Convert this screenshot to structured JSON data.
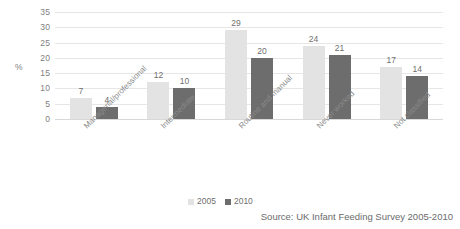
{
  "chart_data": {
    "type": "bar",
    "title": "",
    "subtitle": "",
    "xlabel": "",
    "ylabel": "%",
    "ylim": [
      0,
      35
    ],
    "ytick_step": 5,
    "yticks": [
      "35",
      "30",
      "25",
      "20",
      "15",
      "10",
      "5",
      "0"
    ],
    "grid": true,
    "legend_position": "bottom",
    "categories": [
      "Managerial/professional",
      "Intermediate",
      "Routine and manual",
      "Never worked",
      "Not classified"
    ],
    "series": [
      {
        "name": "2005",
        "color": "#e3e3e3",
        "values": [
          7,
          12,
          29,
          24,
          17
        ]
      },
      {
        "name": "2010",
        "color": "#6d6d6d",
        "values": [
          4,
          10,
          20,
          21,
          14
        ]
      }
    ],
    "annotations": {
      "source": "Source: UK Infant Feeding Survey 2005-2010"
    }
  }
}
